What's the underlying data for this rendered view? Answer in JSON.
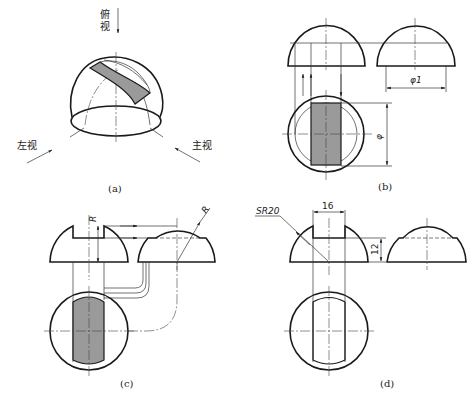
{
  "figure": {
    "panels": [
      {
        "id": "a",
        "caption": "(a)",
        "labels": {
          "top_view": "俯视",
          "left_view": "左视",
          "front_view": "主视"
        }
      },
      {
        "id": "b",
        "caption": "(b)",
        "dimensions": {
          "diameter_1": "φ1",
          "diameter": "φ"
        }
      },
      {
        "id": "c",
        "caption": "(c)",
        "dimensions": {
          "radius_front": "R",
          "radius_side": "R"
        }
      },
      {
        "id": "d",
        "caption": "(d)",
        "dimensions": {
          "sphere_radius": "SR20",
          "slot_width": "16",
          "slot_depth": "12"
        }
      }
    ]
  },
  "colors": {
    "line": "#1a1a1a",
    "shade": "#9a9a9a",
    "background": "#ffffff"
  }
}
